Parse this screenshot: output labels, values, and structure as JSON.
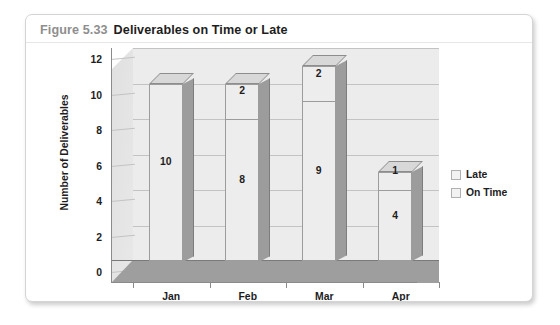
{
  "figure": {
    "number": "Figure 5.33",
    "title": "Deliverables on Time or Late"
  },
  "chart_data": {
    "type": "bar",
    "subtype": "stacked-3d-column",
    "title": "Deliverables on Time or Late",
    "xlabel": "",
    "ylabel": "Number of Deliverables",
    "categories": [
      "Jan",
      "Feb",
      "Mar",
      "Apr"
    ],
    "series": [
      {
        "name": "On Time",
        "values": [
          10,
          8,
          9,
          4
        ],
        "color": "#ededed"
      },
      {
        "name": "Late",
        "values": [
          0,
          2,
          2,
          1
        ],
        "color": "#ededed"
      }
    ],
    "stack_order": [
      "On Time",
      "Late"
    ],
    "totals": [
      10,
      10,
      11,
      5
    ],
    "ylim": [
      0,
      12
    ],
    "yticks": [
      0,
      2,
      4,
      6,
      8,
      10,
      12
    ],
    "ytick_labels": [
      "0",
      "2",
      "4",
      "6",
      "8",
      "10",
      "12"
    ],
    "grid": true,
    "grid_axis": "y",
    "legend": {
      "position": "right",
      "entries": [
        "Late",
        "On Time"
      ]
    },
    "data_labels": {
      "Jan": {
        "On Time": "10",
        "Late": ""
      },
      "Feb": {
        "On Time": "8",
        "Late": "2"
      },
      "Mar": {
        "On Time": "9",
        "Late": "2"
      },
      "Apr": {
        "On Time": "4",
        "Late": "1"
      }
    },
    "colors": {
      "plot_background": "#ececec",
      "gridline": "#c3c3c3",
      "bar_face": "#ededed",
      "bar_side": "#9c9c9c",
      "bar_top": "#d8d8d8",
      "floor": "#9e9e9e",
      "axis": "#8a8a8a",
      "text": "#1d1d1d",
      "caption_number": "#8e8e8e"
    }
  }
}
